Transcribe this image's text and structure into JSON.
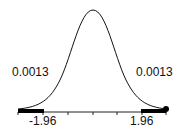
{
  "diagram": {
    "type": "normal-distribution-curve",
    "left_tail_area": "0.0013",
    "right_tail_area": "0.0013",
    "left_critical_value": "-1.96",
    "right_critical_value": "1.96",
    "colors": {
      "curve": "#111111",
      "shaded_tail": "#000000",
      "axis": "#222222"
    }
  }
}
